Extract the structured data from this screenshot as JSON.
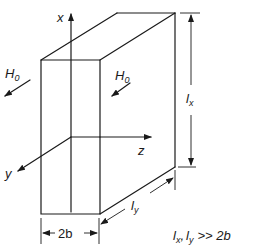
{
  "diagram": {
    "axes": {
      "x_label": "x",
      "y_label": "y",
      "z_label": "z"
    },
    "field_labels": {
      "left": {
        "main": "H",
        "sub": "0"
      },
      "right": {
        "main": "H",
        "sub": "0"
      }
    },
    "dimensions": {
      "height": {
        "main": "l",
        "sub": "x"
      },
      "depth": {
        "main": "l",
        "sub": "y"
      },
      "thickness": "2b"
    },
    "condition": {
      "a_main": "l",
      "a_sub": "x",
      "sep": ",",
      "b_main": "l",
      "b_sub": "y",
      "rel": ">> 2b"
    }
  }
}
